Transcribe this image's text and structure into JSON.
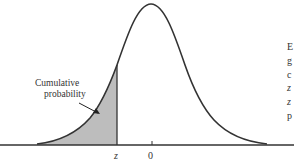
{
  "figure": {
    "shaded_label_line1": "Cumulative",
    "shaded_label_line2": "probability",
    "z_label": "z",
    "zero_label": "0",
    "side_text": [
      "E",
      "g",
      "c",
      "z",
      "z",
      "p"
    ]
  },
  "colors": {
    "curve": "#333333",
    "shade": "#bdbdbd",
    "axis": "#333333"
  }
}
